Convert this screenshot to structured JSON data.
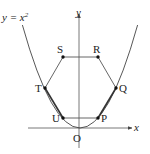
{
  "diagram": {
    "curve_label": "y = x",
    "curve_label_exp": "2",
    "axes": {
      "x_label": "x",
      "y_label": "y",
      "origin_label": "O"
    },
    "points": {
      "P": "P",
      "Q": "Q",
      "R": "R",
      "S": "S",
      "T": "T",
      "U": "U"
    },
    "colors": {
      "line": "#444444",
      "point": "#111111"
    }
  }
}
